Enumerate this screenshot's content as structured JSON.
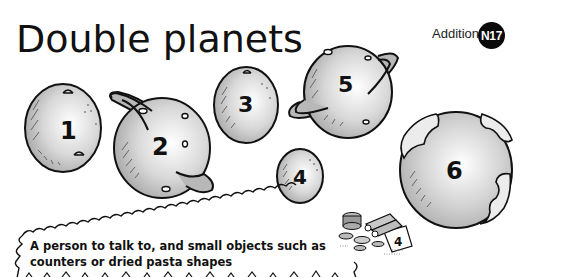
{
  "header": {
    "title": "Double planets",
    "topic": "Addition",
    "badge": "N17"
  },
  "planets": [
    {
      "label": "1",
      "style": "plain-with-craters"
    },
    {
      "label": "2",
      "style": "ringed"
    },
    {
      "label": "3",
      "style": "plain-with-crater"
    },
    {
      "label": "4",
      "style": "small-plain"
    },
    {
      "label": "5",
      "style": "ringed"
    },
    {
      "label": "6",
      "style": "earth-like"
    }
  ],
  "resources_box": {
    "text": "A person to talk to, and small objects such as counters or dried pasta shapes",
    "illustration": "counters-pencils-card-icon",
    "card_number": "4"
  },
  "colors": {
    "planet_fill_light": "#f4f4f4",
    "planet_fill_dark": "#a8a8a8",
    "ring_fill": "#b8b8b8",
    "outline": "#111111",
    "badge_bg": "#0a0a0a"
  }
}
